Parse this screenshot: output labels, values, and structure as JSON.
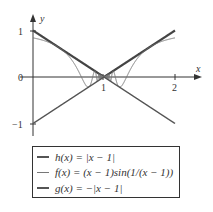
{
  "chart_data": {
    "type": "line",
    "title": "",
    "xlabel": "x",
    "ylabel": "y",
    "xlim": [
      0,
      2.1
    ],
    "ylim": [
      -1,
      1.1
    ],
    "x_ticks": [
      "1",
      "2"
    ],
    "y_ticks": [
      "1",
      "0",
      "-1"
    ],
    "grid": false,
    "legend_position": "below",
    "series": [
      {
        "name": "h(x) = |x − 1|",
        "expression": "|x-1|",
        "style": "thick"
      },
      {
        "name": "f(x) = (x − 1)sin(1/(x − 1))",
        "expression": "(x-1)*sin(1/(x-1))",
        "style": "thin"
      },
      {
        "name": "g(x) = −|x − 1|",
        "expression": "-|x-1|",
        "style": "medium"
      }
    ]
  },
  "axes": {
    "x_label": "x",
    "y_label": "y",
    "tick_x1": "1",
    "tick_x2": "2",
    "tick_y1": "1",
    "tick_y0": "0",
    "tick_ym1": "−1"
  },
  "legend": {
    "items": [
      {
        "label": "h(x) = |x − 1|"
      },
      {
        "label": "f(x) = (x − 1)sin(1/(x − 1))"
      },
      {
        "label": "g(x) = −|x − 1|"
      }
    ]
  }
}
